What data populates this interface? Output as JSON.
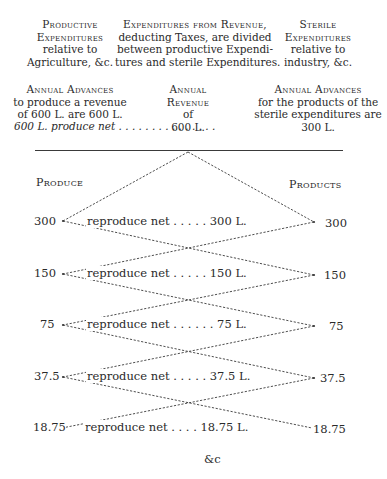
{
  "header": {
    "left": {
      "title_1": "Productive",
      "title_2": "Expenditures",
      "line_3": "relative to",
      "line_4": "Agriculture, &c."
    },
    "center": {
      "title_1": "Expenditures from Revenue,",
      "line_2": "deducting Taxes, are divided",
      "line_3": "between productive Expendi-",
      "line_4": "tures and sterile Expenditures."
    },
    "right": {
      "title_1": "Sterile",
      "title_2": "Expenditures",
      "line_3": "relative to",
      "line_4": "industry, &c."
    }
  },
  "advances": {
    "left": {
      "title": "Annual Advances",
      "line_2": "to produce a revenue",
      "line_3": "of 600 L. are 600 L.",
      "line_4": "600 L. produce net . . . . . . . . . . . . . . ."
    },
    "center": {
      "title_1": "Annual",
      "title_2": "Revenue",
      "line_3": "of",
      "line_4": "600 L."
    },
    "right": {
      "title": "Annual Advances",
      "line_2": "for the products of the",
      "line_3": "sterile expenditures are",
      "line_4": "300 L."
    }
  },
  "columns": {
    "left_label": "Produce",
    "right_label": "Products"
  },
  "rows": [
    {
      "left": "300",
      "middle": "reproduce net . . . . .  300 L.",
      "right": "300"
    },
    {
      "left": "150",
      "middle": "reproduce net . . . . .  150 L.",
      "right": "150"
    },
    {
      "left": "75",
      "middle": "reproduce net . . . . . .  75 L.",
      "right": "75"
    },
    {
      "left": "37.5",
      "middle": "reproduce net . . . . . 37.5 L.",
      "right": "37.5"
    },
    {
      "left": "18.75",
      "middle": "reproduce net . . . . 18.75 L.",
      "right": "18.75"
    }
  ],
  "footer": "&c",
  "colors": {
    "text": "#2a2a2a",
    "lines": "#3a3a3a",
    "background": "#ffffff"
  }
}
